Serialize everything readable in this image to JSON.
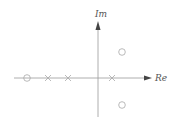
{
  "diagram": {
    "type": "pole-zero plot",
    "axes": {
      "real_label": "Re",
      "imag_label": "Im",
      "color": "#9a9a9a"
    },
    "poles": [
      {
        "name": "pole-1",
        "x": 48,
        "y": 78
      },
      {
        "name": "pole-2",
        "x": 68,
        "y": 78
      },
      {
        "name": "pole-3",
        "x": 112,
        "y": 78
      }
    ],
    "zeros": [
      {
        "name": "zero-real",
        "x": 27,
        "y": 78
      },
      {
        "name": "zero-upper",
        "x": 122,
        "y": 52
      },
      {
        "name": "zero-lower",
        "x": 122,
        "y": 105
      }
    ],
    "marker_color": "#a8a8a8"
  }
}
